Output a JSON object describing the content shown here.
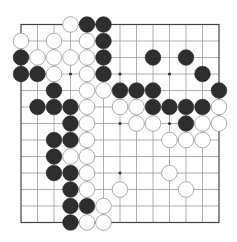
{
  "board": {
    "size": 13,
    "origin_x": 21,
    "origin_y": 24.5,
    "spacing": 16.5,
    "stone_radius": 7.8,
    "colors": {
      "background": "#ffffff",
      "grid": "#9a9a9a",
      "edge": "#444444",
      "black_stone": "#2e2e2e",
      "white_stone": "#ffffff",
      "white_outline": "#8a8a8a"
    },
    "star_points": [
      [
        3,
        3
      ],
      [
        3,
        6
      ],
      [
        3,
        9
      ],
      [
        6,
        6
      ],
      [
        6,
        9
      ],
      [
        9,
        6
      ]
    ],
    "stones": [
      {
        "row": 0,
        "col": 3,
        "color": "white"
      },
      {
        "row": 0,
        "col": 4,
        "color": "black"
      },
      {
        "row": 0,
        "col": 5,
        "color": "black"
      },
      {
        "row": 1,
        "col": 0,
        "color": "white"
      },
      {
        "row": 1,
        "col": 2,
        "color": "white"
      },
      {
        "row": 1,
        "col": 4,
        "color": "white"
      },
      {
        "row": 1,
        "col": 5,
        "color": "black"
      },
      {
        "row": 2,
        "col": 0,
        "color": "black"
      },
      {
        "row": 2,
        "col": 1,
        "color": "white"
      },
      {
        "row": 2,
        "col": 2,
        "color": "white"
      },
      {
        "row": 2,
        "col": 3,
        "color": "white"
      },
      {
        "row": 2,
        "col": 4,
        "color": "white"
      },
      {
        "row": 2,
        "col": 5,
        "color": "black"
      },
      {
        "row": 2,
        "col": 8,
        "color": "black"
      },
      {
        "row": 2,
        "col": 10,
        "color": "black"
      },
      {
        "row": 3,
        "col": 0,
        "color": "black"
      },
      {
        "row": 3,
        "col": 1,
        "color": "black"
      },
      {
        "row": 3,
        "col": 2,
        "color": "white"
      },
      {
        "row": 3,
        "col": 4,
        "color": "white"
      },
      {
        "row": 3,
        "col": 5,
        "color": "black"
      },
      {
        "row": 3,
        "col": 11,
        "color": "black"
      },
      {
        "row": 4,
        "col": 2,
        "color": "black"
      },
      {
        "row": 4,
        "col": 4,
        "color": "white"
      },
      {
        "row": 4,
        "col": 5,
        "color": "white"
      },
      {
        "row": 4,
        "col": 6,
        "color": "black"
      },
      {
        "row": 4,
        "col": 7,
        "color": "black"
      },
      {
        "row": 4,
        "col": 8,
        "color": "black"
      },
      {
        "row": 4,
        "col": 12,
        "color": "black"
      },
      {
        "row": 5,
        "col": 1,
        "color": "black"
      },
      {
        "row": 5,
        "col": 2,
        "color": "black"
      },
      {
        "row": 5,
        "col": 3,
        "color": "black"
      },
      {
        "row": 5,
        "col": 4,
        "color": "white"
      },
      {
        "row": 5,
        "col": 6,
        "color": "white"
      },
      {
        "row": 5,
        "col": 7,
        "color": "white"
      },
      {
        "row": 5,
        "col": 8,
        "color": "black"
      },
      {
        "row": 5,
        "col": 9,
        "color": "black"
      },
      {
        "row": 5,
        "col": 10,
        "color": "black"
      },
      {
        "row": 5,
        "col": 11,
        "color": "black"
      },
      {
        "row": 5,
        "col": 12,
        "color": "white"
      },
      {
        "row": 6,
        "col": 3,
        "color": "black"
      },
      {
        "row": 6,
        "col": 4,
        "color": "white"
      },
      {
        "row": 6,
        "col": 7,
        "color": "white"
      },
      {
        "row": 6,
        "col": 8,
        "color": "white"
      },
      {
        "row": 6,
        "col": 10,
        "color": "black"
      },
      {
        "row": 6,
        "col": 11,
        "color": "white"
      },
      {
        "row": 6,
        "col": 12,
        "color": "white"
      },
      {
        "row": 7,
        "col": 2,
        "color": "black"
      },
      {
        "row": 7,
        "col": 3,
        "color": "black"
      },
      {
        "row": 7,
        "col": 4,
        "color": "white"
      },
      {
        "row": 7,
        "col": 9,
        "color": "white"
      },
      {
        "row": 7,
        "col": 10,
        "color": "white"
      },
      {
        "row": 7,
        "col": 11,
        "color": "white"
      },
      {
        "row": 8,
        "col": 2,
        "color": "black"
      },
      {
        "row": 8,
        "col": 3,
        "color": "white"
      },
      {
        "row": 8,
        "col": 4,
        "color": "white"
      },
      {
        "row": 9,
        "col": 2,
        "color": "black"
      },
      {
        "row": 9,
        "col": 3,
        "color": "black"
      },
      {
        "row": 9,
        "col": 4,
        "color": "white"
      },
      {
        "row": 9,
        "col": 9,
        "color": "white"
      },
      {
        "row": 10,
        "col": 3,
        "color": "black"
      },
      {
        "row": 10,
        "col": 4,
        "color": "white"
      },
      {
        "row": 10,
        "col": 6,
        "color": "white"
      },
      {
        "row": 10,
        "col": 10,
        "color": "white"
      },
      {
        "row": 11,
        "col": 3,
        "color": "black"
      },
      {
        "row": 11,
        "col": 4,
        "color": "black"
      },
      {
        "row": 11,
        "col": 5,
        "color": "white"
      },
      {
        "row": 12,
        "col": 3,
        "color": "black"
      },
      {
        "row": 12,
        "col": 4,
        "color": "white"
      },
      {
        "row": 12,
        "col": 5,
        "color": "white"
      }
    ]
  }
}
